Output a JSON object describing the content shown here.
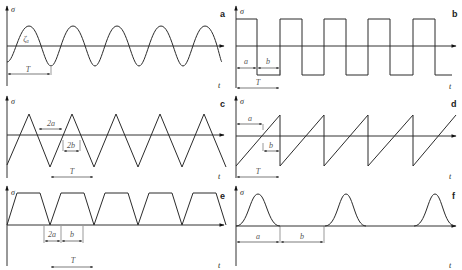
{
  "figure": {
    "panels": [
      {
        "id": "a",
        "letter": "a",
        "shape": "sinusoidal",
        "y_axis": "σ",
        "x_axis": "t",
        "labels": {
          "amplitude": "ζₐ",
          "period": "T"
        }
      },
      {
        "id": "b",
        "letter": "b",
        "shape": "square",
        "y_axis": "σ",
        "x_axis": "t",
        "labels": {
          "a": "a",
          "b": "b",
          "period": "T"
        }
      },
      {
        "id": "c",
        "letter": "c",
        "shape": "triangular",
        "y_axis": "σ",
        "x_axis": "t",
        "labels": {
          "a": "2a",
          "b": "2b",
          "period": "T"
        }
      },
      {
        "id": "d",
        "letter": "d",
        "shape": "sawtooth",
        "y_axis": "σ",
        "x_axis": "t",
        "labels": {
          "a": "a",
          "b": "b",
          "period": "T"
        }
      },
      {
        "id": "e",
        "letter": "e",
        "shape": "trapezoidal",
        "y_axis": "σ",
        "x_axis": "t",
        "labels": {
          "a": "2a",
          "b": "b",
          "period": "T"
        }
      },
      {
        "id": "f",
        "letter": "f",
        "shape": "bell-pulse with dwell",
        "y_axis": "σ",
        "x_axis": "t",
        "labels": {
          "a": "a",
          "b": "b"
        }
      }
    ]
  },
  "colors": {
    "line": "#2b2b2b",
    "label": "#555555"
  }
}
